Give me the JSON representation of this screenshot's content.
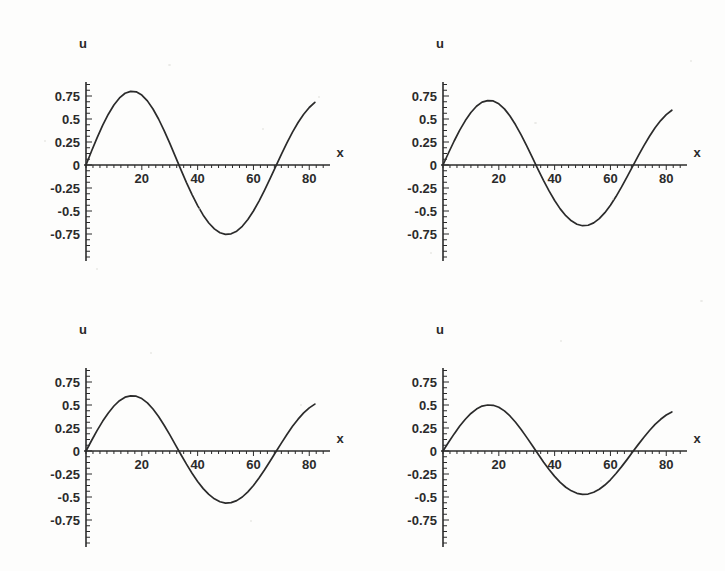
{
  "figure": {
    "background_color": "#fdfdfc",
    "ink_color": "#2b2b2b",
    "panel_count": 4,
    "layout": "2x2"
  },
  "axes_common": {
    "ylabel": "u",
    "xlabel": "x",
    "xticks": [
      20,
      40,
      60,
      80
    ],
    "xtick_labels": [
      "20",
      "40",
      "60",
      "80"
    ],
    "yticks": [
      0.75,
      0.5,
      0.25,
      0,
      -0.25,
      -0.5,
      -0.75
    ],
    "ytick_labels": [
      "0.75",
      "0.5",
      "0.25",
      "0",
      "-0.25",
      "-0.5",
      "-0.75"
    ],
    "xlim": [
      0,
      86
    ],
    "ylim": [
      -1.0,
      0.92
    ],
    "grid": false,
    "minor_ticks": true
  },
  "chart_data": [
    {
      "id": "panel-top-left",
      "type": "line",
      "title": "",
      "xlabel": "x",
      "ylabel": "u",
      "xlim": [
        0,
        86
      ],
      "ylim": [
        -1.0,
        0.92
      ],
      "xticks": [
        20,
        40,
        60,
        80
      ],
      "yticks": [
        0.75,
        0.5,
        0.25,
        0,
        -0.25,
        -0.5,
        -0.75
      ],
      "grid": false,
      "legend": null,
      "amplitude": 0.8,
      "wavelength": 66,
      "series": [
        {
          "name": "u(x)",
          "color": "#2b2b2b",
          "x": [
            0,
            2,
            4,
            6,
            8,
            10,
            12,
            14,
            16,
            18,
            20,
            22,
            24,
            26,
            28,
            30,
            32,
            34,
            36,
            38,
            40,
            42,
            44,
            46,
            48,
            50,
            52,
            54,
            56,
            58,
            60,
            62,
            64,
            66,
            68,
            70,
            72,
            74,
            76,
            78,
            80,
            82
          ],
          "y": [
            0.0,
            0.152,
            0.298,
            0.433,
            0.552,
            0.652,
            0.729,
            0.78,
            0.8,
            0.795,
            0.76,
            0.697,
            0.609,
            0.5,
            0.374,
            0.237,
            0.094,
            -0.05,
            -0.191,
            -0.322,
            -0.441,
            -0.545,
            -0.63,
            -0.694,
            -0.736,
            -0.754,
            -0.748,
            -0.719,
            -0.666,
            -0.592,
            -0.5,
            -0.392,
            -0.272,
            -0.145,
            -0.015,
            0.115,
            0.24,
            0.357,
            0.462,
            0.552,
            0.625,
            0.68
          ]
        }
      ]
    },
    {
      "id": "panel-top-right",
      "type": "line",
      "title": "",
      "xlabel": "x",
      "ylabel": "u",
      "xlim": [
        0,
        86
      ],
      "ylim": [
        -1.0,
        0.92
      ],
      "xticks": [
        20,
        40,
        60,
        80
      ],
      "yticks": [
        0.75,
        0.5,
        0.25,
        0,
        -0.25,
        -0.5,
        -0.75
      ],
      "grid": false,
      "legend": null,
      "amplitude": 0.7,
      "wavelength": 66,
      "series": [
        {
          "name": "u(x)",
          "color": "#2b2b2b",
          "x": [
            0,
            2,
            4,
            6,
            8,
            10,
            12,
            14,
            16,
            18,
            20,
            22,
            24,
            26,
            28,
            30,
            32,
            34,
            36,
            38,
            40,
            42,
            44,
            46,
            48,
            50,
            52,
            54,
            56,
            58,
            60,
            62,
            64,
            66,
            68,
            70,
            72,
            74,
            76,
            78,
            80,
            82
          ],
          "y": [
            0.0,
            0.133,
            0.261,
            0.379,
            0.483,
            0.571,
            0.638,
            0.683,
            0.7,
            0.696,
            0.665,
            0.61,
            0.533,
            0.437,
            0.327,
            0.207,
            0.082,
            -0.044,
            -0.167,
            -0.282,
            -0.386,
            -0.477,
            -0.551,
            -0.607,
            -0.644,
            -0.66,
            -0.655,
            -0.629,
            -0.583,
            -0.518,
            -0.438,
            -0.343,
            -0.238,
            -0.127,
            -0.013,
            0.101,
            0.21,
            0.312,
            0.404,
            0.483,
            0.547,
            0.595
          ]
        }
      ]
    },
    {
      "id": "panel-bottom-left",
      "type": "line",
      "title": "",
      "xlabel": "x",
      "ylabel": "u",
      "xlim": [
        0,
        86
      ],
      "ylim": [
        -1.0,
        0.92
      ],
      "xticks": [
        20,
        40,
        60,
        80
      ],
      "yticks": [
        0.75,
        0.5,
        0.25,
        0,
        -0.25,
        -0.5,
        -0.75
      ],
      "grid": false,
      "legend": null,
      "amplitude": 0.6,
      "wavelength": 66,
      "series": [
        {
          "name": "u(x)",
          "color": "#2b2b2b",
          "x": [
            0,
            2,
            4,
            6,
            8,
            10,
            12,
            14,
            16,
            18,
            20,
            22,
            24,
            26,
            28,
            30,
            32,
            34,
            36,
            38,
            40,
            42,
            44,
            46,
            48,
            50,
            52,
            54,
            56,
            58,
            60,
            62,
            64,
            66,
            68,
            70,
            72,
            74,
            76,
            78,
            80,
            82
          ],
          "y": [
            0.0,
            0.114,
            0.224,
            0.325,
            0.414,
            0.489,
            0.547,
            0.585,
            0.6,
            0.596,
            0.57,
            0.523,
            0.457,
            0.375,
            0.28,
            0.178,
            0.07,
            -0.038,
            -0.143,
            -0.242,
            -0.331,
            -0.409,
            -0.472,
            -0.52,
            -0.552,
            -0.566,
            -0.561,
            -0.539,
            -0.5,
            -0.444,
            -0.375,
            -0.294,
            -0.204,
            -0.109,
            -0.011,
            0.086,
            0.18,
            0.268,
            0.346,
            0.414,
            0.469,
            0.51
          ]
        }
      ]
    },
    {
      "id": "panel-bottom-right",
      "type": "line",
      "title": "",
      "xlabel": "x",
      "ylabel": "u",
      "xlim": [
        0,
        86
      ],
      "ylim": [
        -1.0,
        0.92
      ],
      "xticks": [
        20,
        40,
        60,
        80
      ],
      "yticks": [
        0.75,
        0.5,
        0.25,
        0,
        -0.25,
        -0.5,
        -0.75
      ],
      "grid": false,
      "legend": null,
      "amplitude": 0.5,
      "wavelength": 66,
      "series": [
        {
          "name": "u(x)",
          "color": "#2b2b2b",
          "x": [
            0,
            2,
            4,
            6,
            8,
            10,
            12,
            14,
            16,
            18,
            20,
            22,
            24,
            26,
            28,
            30,
            32,
            34,
            36,
            38,
            40,
            42,
            44,
            46,
            48,
            50,
            52,
            54,
            56,
            58,
            60,
            62,
            64,
            66,
            68,
            70,
            72,
            74,
            76,
            78,
            80,
            82
          ],
          "y": [
            0.0,
            0.095,
            0.186,
            0.271,
            0.345,
            0.408,
            0.456,
            0.488,
            0.5,
            0.497,
            0.475,
            0.436,
            0.381,
            0.313,
            0.234,
            0.148,
            0.059,
            -0.031,
            -0.119,
            -0.202,
            -0.276,
            -0.341,
            -0.394,
            -0.433,
            -0.46,
            -0.471,
            -0.468,
            -0.449,
            -0.416,
            -0.37,
            -0.313,
            -0.245,
            -0.17,
            -0.091,
            -0.009,
            0.072,
            0.15,
            0.223,
            0.289,
            0.345,
            0.391,
            0.425
          ]
        }
      ]
    }
  ],
  "panels": {
    "top_left": {
      "ylabel": "u",
      "xlabel": "x"
    },
    "top_right": {
      "ylabel": "u",
      "xlabel": "x"
    },
    "bottom_left": {
      "ylabel": "u",
      "xlabel": "x"
    },
    "bottom_right": {
      "ylabel": "u",
      "xlabel": "x"
    }
  },
  "tick_text": {
    "y": [
      "0.75",
      "0.5",
      "0.25",
      "0",
      "-0.25",
      "-0.5",
      "-0.75"
    ],
    "x": [
      "20",
      "40",
      "60",
      "80"
    ]
  }
}
